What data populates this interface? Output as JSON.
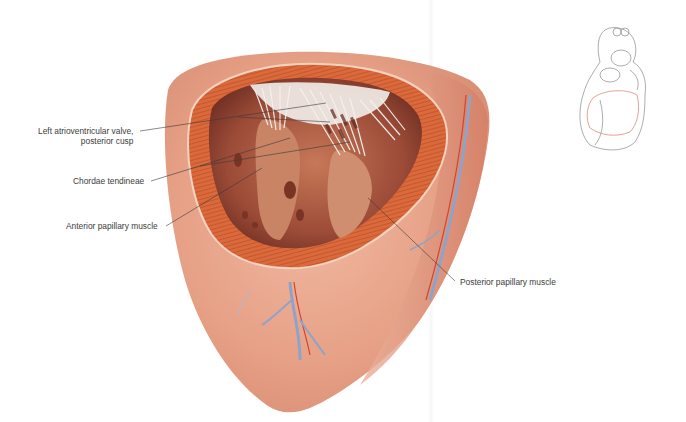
{
  "figure": {
    "labels": {
      "valve_line1": "Left atrioventricular valve,",
      "valve_line2": "posterior cusp",
      "chordae": "Chordae tendineae",
      "anterior_papillary": "Anterior papillary muscle",
      "posterior_papillary": "Posterior papillary muscle"
    },
    "colors": {
      "myocardium_outer": "#e9a98f",
      "myocardium_cut": "#d9683a",
      "cavity": "#a0533f",
      "chordae": "#f2f0ee",
      "artery": "#d2452e",
      "vein": "#8fa3c8",
      "leader_line": "#3a3a3a",
      "inset_outline": "#8a8a8a",
      "inset_highlight": "#e4a394"
    }
  }
}
